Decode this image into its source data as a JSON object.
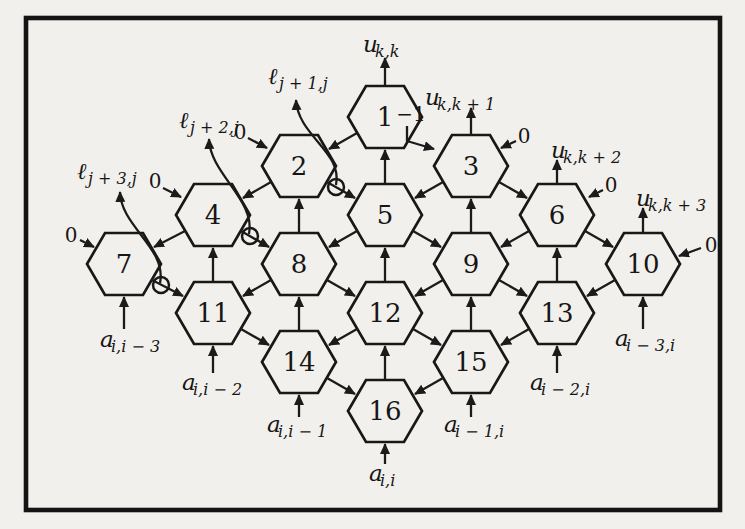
{
  "figure": {
    "colors": {
      "paper": "#f2f0ec",
      "ink": "#1b1b1b"
    }
  },
  "cells": [
    {
      "label": "1"
    },
    {
      "label": "2"
    },
    {
      "label": "3"
    },
    {
      "label": "4"
    },
    {
      "label": "5"
    },
    {
      "label": "6"
    },
    {
      "label": "7"
    },
    {
      "label": "8"
    },
    {
      "label": "9"
    },
    {
      "label": "10"
    },
    {
      "label": "11"
    },
    {
      "label": "12"
    },
    {
      "label": "13"
    },
    {
      "label": "14"
    },
    {
      "label": "15"
    },
    {
      "label": "16"
    }
  ],
  "u_outputs": [
    {
      "base": "u",
      "sub": "k,k"
    },
    {
      "base": "u",
      "sub": "k,k + 1"
    },
    {
      "base": "u",
      "sub": "k,k + 2"
    },
    {
      "base": "u",
      "sub": "k,k + 3"
    }
  ],
  "l_outputs": [
    {
      "base": "ℓ",
      "sub": "j + 1,j"
    },
    {
      "base": "ℓ",
      "sub": "j + 2,j"
    },
    {
      "base": "ℓ",
      "sub": "j + 3,j"
    }
  ],
  "a_inputs": [
    {
      "base": "a",
      "sub": "i,i − 3"
    },
    {
      "base": "a",
      "sub": "i,i − 2"
    },
    {
      "base": "a",
      "sub": "i,i − 1"
    },
    {
      "base": "a",
      "sub": "i,i"
    },
    {
      "base": "a",
      "sub": "i − 1,i"
    },
    {
      "base": "a",
      "sub": "i − 2,i"
    },
    {
      "base": "a",
      "sub": "i − 3,i"
    }
  ],
  "boundary_inputs": {
    "zeros": [
      "0",
      "0",
      "0",
      "0",
      "0",
      "0"
    ],
    "minus_one": "−1"
  }
}
